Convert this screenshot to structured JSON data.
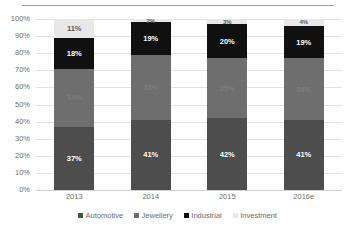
{
  "chart_data": {
    "type": "bar",
    "subtype": "100% stacked column",
    "title": "",
    "xlabel": "",
    "ylabel": "",
    "ylim": [
      0,
      100
    ],
    "ytick_labels": [
      "100%",
      "90%",
      "80%",
      "70%",
      "60%",
      "50%",
      "40%",
      "30%",
      "20%",
      "10%",
      "0%"
    ],
    "ytick_values": [
      100,
      90,
      80,
      70,
      60,
      50,
      40,
      30,
      20,
      10,
      0
    ],
    "grid": true,
    "legend_position": "bottom",
    "categories": [
      "2013",
      "2014",
      "2015",
      "2016e"
    ],
    "series": [
      {
        "name": "Automotive",
        "color": "#4d4d4d",
        "values": [
          37,
          41,
          42,
          41
        ],
        "labels": [
          "37%",
          "41%",
          "42%",
          "41%"
        ],
        "label_color": "#ffffff"
      },
      {
        "name": "Jewellery",
        "color": "#6e6e6e",
        "values": [
          34,
          38,
          35,
          36
        ],
        "labels": [
          "34%",
          "38%",
          "35%",
          "36%"
        ],
        "label_color": "#7d7d7d"
      },
      {
        "name": "Industrial",
        "color": "#101010",
        "values": [
          18,
          19,
          20,
          19
        ],
        "labels": [
          "18%",
          "19%",
          "20%",
          "19%"
        ],
        "label_color": "#ffffff"
      },
      {
        "name": "Investment",
        "color": "#e8e8e8",
        "values": [
          11,
          2,
          3,
          4
        ],
        "labels": [
          "11%",
          "2%",
          "3%",
          "4%"
        ],
        "label_color": "#595959"
      }
    ],
    "column_totals": [
      100,
      100,
      100,
      100
    ]
  },
  "legend": {
    "items": [
      {
        "label": "Automotive",
        "color": "#4d4d4d"
      },
      {
        "label": "Jewellery",
        "color": "#6e6e6e"
      },
      {
        "label": "Industrial",
        "color": "#101010"
      },
      {
        "label": "Investment",
        "color": "#e8e8e8"
      }
    ]
  }
}
